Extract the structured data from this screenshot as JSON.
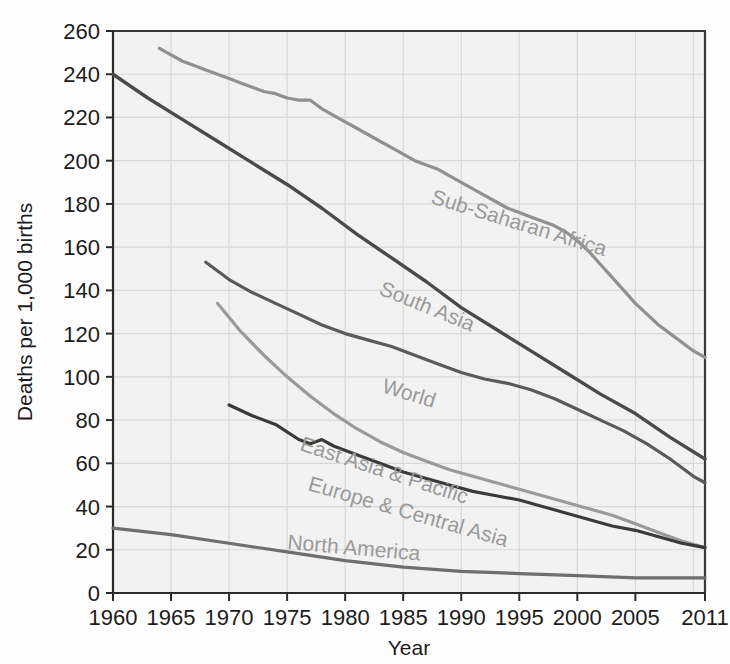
{
  "chart_data": {
    "type": "line",
    "title": "",
    "xlabel": "Year",
    "ylabel": "Deaths per 1,000 births",
    "xlim": [
      1960,
      2011
    ],
    "ylim": [
      0,
      260
    ],
    "grid": true,
    "legend_position": "inline-labels",
    "xticks": [
      "1960",
      "1965",
      "1970",
      "1975",
      "1980",
      "1985",
      "1990",
      "1995",
      "2000",
      "2005",
      "2011"
    ],
    "yticks": [
      "0",
      "20",
      "40",
      "60",
      "80",
      "100",
      "120",
      "140",
      "160",
      "180",
      "200",
      "220",
      "240",
      "260"
    ],
    "series": [
      {
        "name": "Sub-Saharan Africa",
        "color": "#909090",
        "label_color": "#a8a8a8",
        "x": [
          1964,
          1965,
          1966,
          1967,
          1968,
          1969,
          1970,
          1971,
          1972,
          1973,
          1974,
          1975,
          1976,
          1977,
          1978,
          1979,
          1980,
          1981,
          1982,
          1983,
          1984,
          1985,
          1986,
          1987,
          1988,
          1989,
          1990,
          1991,
          1992,
          1993,
          1994,
          1995,
          1996,
          1997,
          1998,
          1999,
          2000,
          2001,
          2002,
          2003,
          2004,
          2005,
          2006,
          2007,
          2008,
          2009,
          2010,
          2011
        ],
        "y": [
          252,
          249,
          246,
          244,
          242,
          240,
          238,
          236,
          234,
          232,
          231,
          229,
          228,
          228,
          224,
          221,
          218,
          215,
          212,
          209,
          206,
          203,
          200,
          198,
          196,
          193,
          190,
          187,
          184,
          181,
          178,
          176,
          174,
          172,
          170,
          167,
          163,
          158,
          152,
          146,
          140,
          134,
          129,
          124,
          120,
          116,
          112,
          109
        ]
      },
      {
        "name": "South Asia",
        "color": "#4a4a4a",
        "label_color": "#777777",
        "x": [
          1960,
          1963,
          1966,
          1969,
          1972,
          1975,
          1978,
          1981,
          1984,
          1987,
          1990,
          1993,
          1996,
          1999,
          2002,
          2005,
          2008,
          2011
        ],
        "y": [
          240,
          229,
          219,
          209,
          199,
          189,
          178,
          166,
          155,
          144,
          132,
          122,
          112,
          102,
          92,
          83,
          72,
          62
        ]
      },
      {
        "name": "World",
        "color": "#5a5a5a",
        "label_color": "#8a8a8a",
        "x": [
          1968,
          1970,
          1972,
          1974,
          1976,
          1978,
          1980,
          1982,
          1984,
          1986,
          1988,
          1990,
          1992,
          1994,
          1996,
          1998,
          2000,
          2002,
          2004,
          2006,
          2008,
          2010,
          2011
        ],
        "y": [
          153,
          145,
          139,
          134,
          129,
          124,
          120,
          117,
          114,
          110,
          106,
          102,
          99,
          97,
          94,
          90,
          85,
          80,
          75,
          69,
          62,
          54,
          51
        ]
      },
      {
        "name": "East Asia & Pacific",
        "color": "#9a9a9a",
        "label_color": "#a8a8a8",
        "x": [
          1969,
          1971,
          1973,
          1975,
          1977,
          1979,
          1981,
          1983,
          1985,
          1987,
          1989,
          1991,
          1993,
          1995,
          1997,
          1999,
          2001,
          2003,
          2005,
          2007,
          2009,
          2011
        ],
        "y": [
          134,
          121,
          110,
          100,
          91,
          83,
          76,
          70,
          65,
          61,
          57,
          54,
          51,
          48,
          45,
          42,
          39,
          36,
          32,
          28,
          24,
          21
        ]
      },
      {
        "name": "Europe & Central Asia",
        "color": "#3a3a3a",
        "label_color": "#6f6f6f",
        "x": [
          1970,
          1972,
          1974,
          1976,
          1977,
          1978,
          1979,
          1981,
          1983,
          1985,
          1987,
          1989,
          1991,
          1993,
          1995,
          1997,
          1999,
          2001,
          2003,
          2005,
          2007,
          2009,
          2011
        ],
        "y": [
          87,
          82,
          78,
          71,
          69,
          71,
          68,
          64,
          60,
          56,
          53,
          50,
          47,
          45,
          43,
          40,
          37,
          34,
          31,
          29,
          26,
          23,
          21
        ]
      },
      {
        "name": "North America",
        "color": "#6e6e6e",
        "label_color": "#9a9a9a",
        "x": [
          1960,
          1965,
          1970,
          1975,
          1980,
          1985,
          1990,
          1995,
          2000,
          2005,
          2011
        ],
        "y": [
          30,
          27,
          23,
          19,
          15,
          12,
          10,
          9,
          8,
          7,
          7
        ]
      }
    ],
    "inline_labels": [
      {
        "text": "Sub-Saharan Africa",
        "x": 430,
        "y": 203,
        "rotate": 17
      },
      {
        "text": "South Asia",
        "x": 378,
        "y": 294,
        "rotate": 22
      },
      {
        "text": "World",
        "x": 381,
        "y": 392,
        "rotate": 17
      },
      {
        "text": "East Asia & Pacific",
        "x": 299,
        "y": 450,
        "rotate": 18
      },
      {
        "text": "Europe & Central Asia",
        "x": 307,
        "y": 490,
        "rotate": 16
      },
      {
        "text": "North America",
        "x": 287,
        "y": 549,
        "rotate": 5
      }
    ]
  }
}
